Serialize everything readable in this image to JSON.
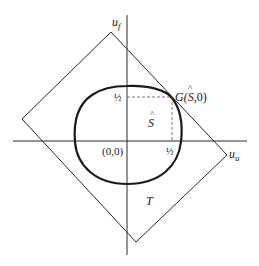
{
  "diagram": {
    "axes": {
      "vertical_label": "u",
      "vertical_subscript": "f",
      "horizontal_label": "u",
      "horizontal_subscript": "u"
    },
    "origin_label": "(0,0)",
    "tick_half_x": "½",
    "tick_half_y": "½",
    "region_S_label": "S",
    "region_S_hat": "^",
    "region_T_label": "T",
    "point_G": {
      "prefix": "G(",
      "s": "S",
      "hat": "^",
      "suffix": ",0)"
    },
    "colors": {
      "line": "#2a2a2a",
      "curve": "#1a1a1a",
      "dashed": "#555555",
      "background": "#ffffff"
    }
  }
}
